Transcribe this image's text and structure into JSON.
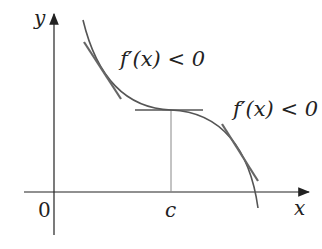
{
  "axes": {
    "x_label": "x",
    "y_label": "y",
    "origin_label": "0",
    "c_label": "c"
  },
  "annotations": {
    "left": "f′(x) < 0",
    "right": "f′(x) < 0"
  },
  "colors": {
    "axis": "#222222",
    "curve": "#555555",
    "tangent": "#777777"
  }
}
